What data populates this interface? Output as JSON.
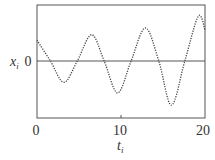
{
  "chart_data": {
    "type": "line",
    "title": "",
    "xlabel": "t_i",
    "ylabel": "x_i",
    "xlim": [
      0,
      20
    ],
    "ylim": [
      -1.0,
      1.0
    ],
    "x_ticks": [
      0,
      10,
      20
    ],
    "x_tick_labels": [
      "0",
      "10",
      "20"
    ],
    "y_ticks": [
      0
    ],
    "y_tick_labels": [
      "0"
    ],
    "grid": false,
    "legend": null,
    "series": [
      {
        "name": "x_i",
        "style": "dotted",
        "color": "#444444",
        "description": "growing oscillation, period ~6.3, amplitude increasing with t",
        "x": [
          0,
          1.6,
          3.2,
          4.8,
          6.5,
          8.0,
          9.6,
          11.2,
          12.9,
          14.5,
          16.0,
          17.6,
          19.2,
          20
        ],
        "y": [
          0.37,
          0.0,
          -0.38,
          0.0,
          0.47,
          0.0,
          -0.57,
          0.0,
          0.59,
          0.0,
          -0.79,
          0.0,
          0.8,
          0.55
        ]
      }
    ],
    "reference_lines": [
      {
        "type": "horizontal",
        "y": 0,
        "style": "solid"
      }
    ]
  },
  "labels": {
    "x_axis": "t",
    "x_axis_sub": "i",
    "y_axis": "x",
    "y_axis_sub": "i",
    "y_zero": "0",
    "x_tick_0": "0",
    "x_tick_10": "10",
    "x_tick_20": "20"
  },
  "colors": {
    "frame": "#555555",
    "curve": "#444444",
    "zero_line": "#555555",
    "text": "#333333"
  }
}
